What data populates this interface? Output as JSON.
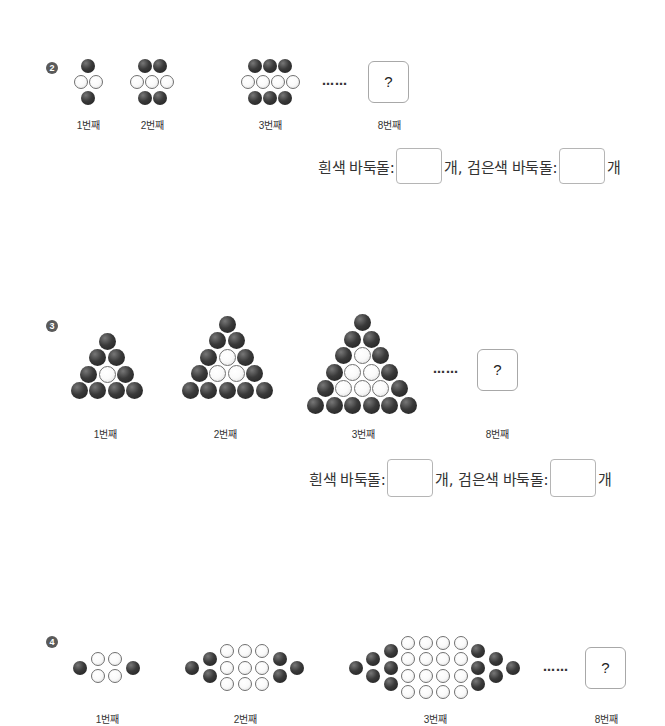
{
  "problems": [
    {
      "number": "2",
      "marker_glyph": "2",
      "steps": [
        {
          "label": "1번째",
          "cx": 88,
          "cy": 82,
          "rows": [
            [
              "b"
            ],
            [
              "w",
              "w"
            ],
            [
              "b"
            ]
          ]
        },
        {
          "label": "2번째",
          "cx": 152,
          "cy": 82,
          "rows": [
            [
              "b",
              "b"
            ],
            [
              "w",
              "w",
              "w"
            ],
            [
              "b",
              "b"
            ]
          ]
        },
        {
          "label": "3번째",
          "cx": 270,
          "cy": 82,
          "rows": [
            [
              "b",
              "b",
              "b"
            ],
            [
              "w",
              "w",
              "w",
              "w"
            ],
            [
              "b",
              "b",
              "b"
            ]
          ]
        }
      ],
      "ellipsis": "……",
      "target": {
        "label": "8번째",
        "box_text": "?"
      },
      "answer": {
        "white_label": "흰색 바둑돌:",
        "white_unit": "개,",
        "black_label": "검은색 바둑돌:",
        "black_unit": "개",
        "white_value": "",
        "black_value": ""
      }
    },
    {
      "number": "3",
      "marker_glyph": "3",
      "steps": [
        {
          "label": "1번째",
          "cx": 107,
          "cy": 366,
          "rows": [
            [
              "b"
            ],
            [
              "b",
              "b"
            ],
            [
              "b",
              "w",
              "b"
            ],
            [
              "b",
              "b",
              "b",
              "b"
            ]
          ]
        },
        {
          "label": "2번째",
          "cx": 227,
          "cy": 357,
          "rows": [
            [
              "b"
            ],
            [
              "b",
              "b"
            ],
            [
              "b",
              "w",
              "b"
            ],
            [
              "b",
              "w",
              "w",
              "b"
            ],
            [
              "b",
              "b",
              "b",
              "b",
              "b"
            ]
          ]
        },
        {
          "label": "3번째",
          "cx": 362,
          "cy": 364,
          "rows": [
            [
              "b"
            ],
            [
              "b",
              "b"
            ],
            [
              "b",
              "w",
              "b"
            ],
            [
              "b",
              "w",
              "w",
              "b"
            ],
            [
              "b",
              "w",
              "w",
              "w",
              "b"
            ],
            [
              "b",
              "b",
              "b",
              "b",
              "b",
              "b"
            ]
          ]
        }
      ],
      "ellipsis": "……",
      "target": {
        "label": "8번째",
        "box_text": "?"
      },
      "answer": {
        "white_label": "흰색 바둑돌:",
        "white_unit": "개,",
        "black_label": "검은색 바둑돌:",
        "black_unit": "개",
        "white_value": "",
        "black_value": ""
      }
    },
    {
      "number": "4",
      "marker_glyph": "4",
      "steps": [
        {
          "label": "1번째",
          "cx": 107,
          "cy": 668,
          "cols": [
            [
              "b"
            ],
            [
              "w",
              "w"
            ],
            [
              "w",
              "w"
            ],
            [
              "b"
            ]
          ]
        },
        {
          "label": "2번째",
          "cx": 245,
          "cy": 668,
          "cols": [
            [
              "b"
            ],
            [
              "b",
              "b"
            ],
            [
              "w",
              "w",
              "w"
            ],
            [
              "w",
              "w",
              "w"
            ],
            [
              "w",
              "w",
              "w"
            ],
            [
              "b",
              "b"
            ],
            [
              "b"
            ]
          ]
        },
        {
          "label": "3번째",
          "cx": 435,
          "cy": 668,
          "cols": [
            [
              "b"
            ],
            [
              "b",
              "b"
            ],
            [
              "b",
              "b",
              "b"
            ],
            [
              "w",
              "w",
              "w",
              "w"
            ],
            [
              "w",
              "w",
              "w",
              "w"
            ],
            [
              "w",
              "w",
              "w",
              "w"
            ],
            [
              "w",
              "w",
              "w",
              "w"
            ],
            [
              "b",
              "b",
              "b"
            ],
            [
              "b",
              "b"
            ],
            [
              "b"
            ]
          ]
        }
      ],
      "ellipsis": "……",
      "target": {
        "label": "8번째",
        "box_text": "?"
      }
    }
  ],
  "labels": {
    "p2_step1": "1번째",
    "p2_step2": "2번째",
    "p2_step3": "3번째",
    "p2_target": "8번째",
    "p3_step1": "1번째",
    "p3_step2": "2번째",
    "p3_step3": "3번째",
    "p3_target": "8번째",
    "p4_step1": "1번째",
    "p4_step2": "2번째",
    "p4_step3": "3번째",
    "p4_target": "8번째",
    "question_mark": "?",
    "ellipsis": "……",
    "white_label": "흰색 바둑돌:",
    "white_unit": "개,",
    "black_label": "검은색 바둑돌:",
    "black_unit": "개",
    "marker_2": "❷",
    "marker_3": "❸",
    "marker_4": "❹"
  }
}
